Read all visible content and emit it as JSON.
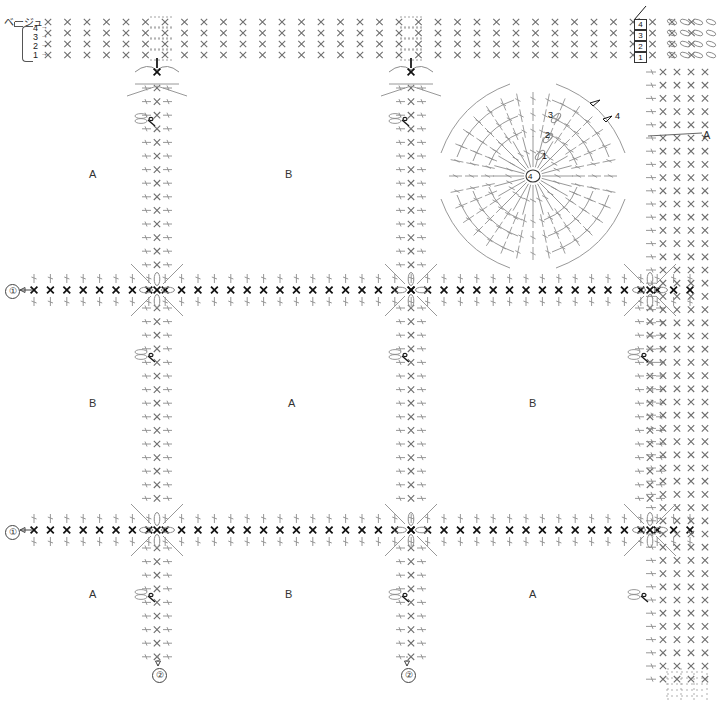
{
  "diagram": {
    "type": "crochet-chart",
    "title_text": "ベージュ",
    "width": 717,
    "height": 701,
    "background": "#ffffff",
    "stitch_color": "#8c8c8c",
    "dark_stitch_color": "#1a1a1a",
    "label_color": "#333333"
  },
  "legend": {
    "yarn_label": "ベージュ",
    "row_numbers": [
      "4",
      "3",
      "2",
      "1"
    ],
    "row_arrow": "→"
  },
  "top_right_rounds": {
    "numbers": [
      "4",
      "3",
      "2",
      "1"
    ]
  },
  "blocks": [
    {
      "letter": "A",
      "x": 92,
      "y": 175
    },
    {
      "letter": "B",
      "x": 288,
      "y": 175
    },
    {
      "letter": "B",
      "x": 92,
      "y": 404
    },
    {
      "letter": "A",
      "x": 291,
      "y": 404
    },
    {
      "letter": "B",
      "x": 532,
      "y": 404
    },
    {
      "letter": "A",
      "x": 92,
      "y": 595
    },
    {
      "letter": "B",
      "x": 288,
      "y": 595
    },
    {
      "letter": "A",
      "x": 532,
      "y": 595
    }
  ],
  "edge_labels": [
    {
      "text": "A",
      "x": 706,
      "y": 136
    }
  ],
  "motif": {
    "center_label": "4",
    "round_labels": [
      "1",
      "2",
      "3"
    ],
    "side_label": "4"
  },
  "row_markers": [
    {
      "label": "①",
      "x": 8,
      "y": 286,
      "arrow": "←"
    },
    {
      "label": "①",
      "x": 8,
      "y": 527,
      "arrow": "←"
    },
    {
      "label": "②",
      "x": 158,
      "y": 668,
      "arrow": "up"
    },
    {
      "label": "②",
      "x": 407,
      "y": 668,
      "arrow": "up"
    }
  ],
  "grid": {
    "columns_x": [
      157,
      411,
      650
    ],
    "rows_y": [
      290,
      530,
      62
    ],
    "x_stitch_glyph": "×",
    "chain_glyph": "○"
  },
  "chart_data": {
    "type": "table",
    "legend_entries": [
      "ベージュ"
    ],
    "motif_rounds": [
      "1",
      "2",
      "3",
      "4"
    ],
    "block_sequence": [
      [
        "A",
        "B",
        "motif"
      ],
      [
        "B",
        "A",
        "B"
      ],
      [
        "A",
        "B",
        "A"
      ]
    ]
  }
}
